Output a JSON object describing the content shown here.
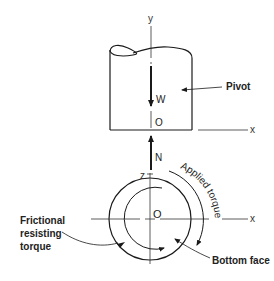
{
  "figure": {
    "type": "engineering-diagram"
  },
  "labels": {
    "y_axis": "y",
    "x_axis_top": "x",
    "x_axis_bottom": "x",
    "z_axis": "z",
    "origin_top": "O",
    "origin_bottom": "O",
    "force_weight": "W",
    "force_normal": "N",
    "pivot": "Pivot",
    "applied_torque": "Applied torque",
    "frictional_line1": "Frictional",
    "frictional_line2": "resisting",
    "frictional_line3": "torque",
    "bottom_face": "Bottom face"
  },
  "colors": {
    "line": "#1a1a1a",
    "axis": "#333333",
    "background": "#ffffff"
  }
}
